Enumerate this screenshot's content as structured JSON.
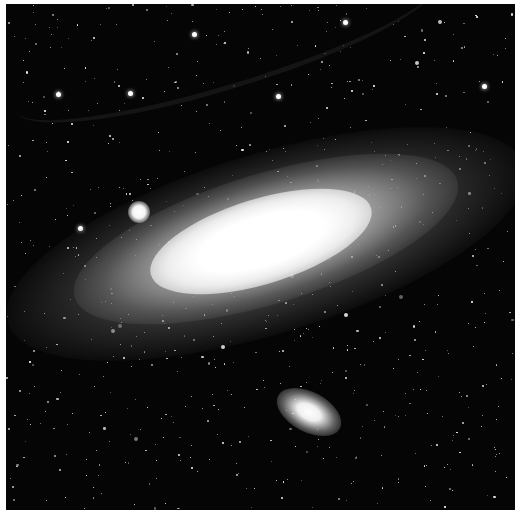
{
  "image": {
    "subject": "Andromeda Galaxy (M31) spiral galaxy with companion satellite galaxies against a dense starfield",
    "palette": {
      "background": "#050505",
      "core": "#ffffff",
      "disk": "#bdbdbd",
      "border": "#ffffff"
    },
    "features": [
      {
        "name": "galaxy-core",
        "description": "Bright elongated central bulge, tilted diagonally"
      },
      {
        "name": "spiral-disk",
        "description": "Grey dusty spiral arms with dark dust lanes"
      },
      {
        "name": "satellite-galaxy-upper",
        "description": "Small bright round satellite galaxy left of the core"
      },
      {
        "name": "satellite-galaxy-lower",
        "description": "Elliptical satellite galaxy below the disk"
      },
      {
        "name": "starfield",
        "description": "Numerous foreground stars scattered across the frame"
      }
    ]
  }
}
